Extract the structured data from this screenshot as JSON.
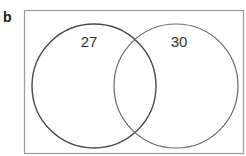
{
  "panel_label": "b",
  "diagram": {
    "type": "venn",
    "sets": [
      {
        "name": "left-set",
        "count": "27",
        "stroke": "#4a4a4a"
      },
      {
        "name": "right-set",
        "count": "30",
        "stroke": "#6a6a6a"
      }
    ],
    "border_color": "#9a9a9a"
  }
}
